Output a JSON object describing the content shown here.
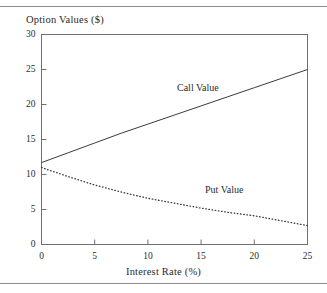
{
  "figure": {
    "top_rule": "horizontal-rule",
    "bottom_rule": "horizontal-rule"
  },
  "chart_data": {
    "type": "line",
    "title": "",
    "subtitle": "",
    "ylabel": "Option Values ($)",
    "xlabel": "Interest Rate (%)",
    "xlim": [
      0,
      25
    ],
    "ylim": [
      0,
      30
    ],
    "xticks": [
      0,
      5,
      10,
      15,
      20,
      25
    ],
    "yticks": [
      0,
      5,
      10,
      15,
      20,
      25,
      30
    ],
    "xtick_labels": [
      "0",
      "5",
      "10",
      "15",
      "20",
      "25"
    ],
    "ytick_labels": [
      "0",
      "5",
      "10",
      "15",
      "20",
      "25",
      "30"
    ],
    "grid": false,
    "legend_position": "inline-annotation",
    "x": [
      0,
      2.5,
      5,
      7.5,
      10,
      12.5,
      15,
      17.5,
      20,
      22.5,
      25
    ],
    "series": [
      {
        "name": "Call Value",
        "style": "solid",
        "color": "#3a3a3a",
        "values": [
          11.7,
          13.1,
          14.5,
          15.9,
          17.2,
          18.5,
          19.8,
          21.1,
          22.4,
          23.7,
          25.0
        ],
        "annotation": {
          "text": "Call Value",
          "x_px": 177,
          "y_px": 82
        }
      },
      {
        "name": "Put Value",
        "style": "dotted",
        "color": "#3a3a3a",
        "values": [
          11.0,
          9.7,
          8.5,
          7.5,
          6.6,
          5.9,
          5.2,
          4.6,
          4.1,
          3.4,
          2.7
        ],
        "annotation": {
          "text": "Put Value",
          "x_px": 205,
          "y_px": 184
        }
      }
    ]
  }
}
